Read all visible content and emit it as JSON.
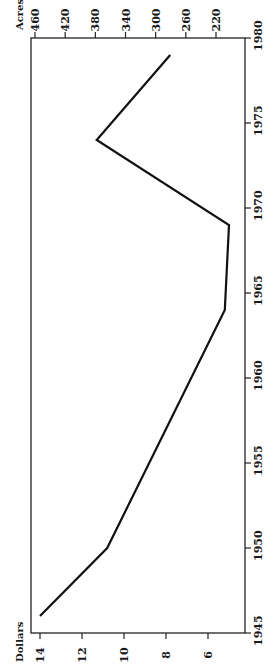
{
  "chart_data": {
    "type": "line",
    "orientation": "rotated-90-ccw",
    "title": "",
    "xlabel": "",
    "ylabel": "Dollars",
    "y2label": "Acres",
    "x_ticks": [
      1945,
      1950,
      1955,
      1960,
      1965,
      1970,
      1975,
      1980
    ],
    "xlim": [
      1945,
      1980
    ],
    "y_ticks": [
      14,
      12,
      10,
      8,
      6
    ],
    "ylim": [
      4,
      14.4
    ],
    "y2_ticks": [
      460,
      420,
      380,
      340,
      300,
      260,
      220
    ],
    "grid": false,
    "legend": null,
    "series": [
      {
        "name": "Dollars",
        "x": [
          1946,
          1950,
          1964,
          1969,
          1974,
          1979
        ],
        "values": [
          14.0,
          10.8,
          5.2,
          5.0,
          11.3,
          7.8
        ]
      }
    ]
  },
  "labels": {
    "dollars": "Dollars",
    "acres": "Acres"
  }
}
